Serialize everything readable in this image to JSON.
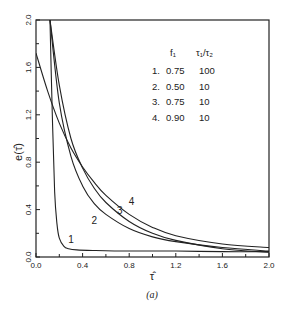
{
  "chart_data": {
    "type": "line",
    "title": "",
    "caption": "(a)",
    "xlabel": "τ̂",
    "ylabel": "e(τ̂)",
    "xlim": [
      0.0,
      2.0
    ],
    "ylim": [
      0.0,
      2.0
    ],
    "xticks": [
      "0.0",
      "0.4",
      "0.8",
      "1.2",
      "1.6",
      "2.0"
    ],
    "yticks": [
      "0.0",
      "0.4",
      "0.8",
      "1.2",
      "1.6",
      "2.0"
    ],
    "grid": false,
    "legend": {
      "position": "upper-right",
      "headers": [
        "",
        "f₁",
        "τ₁/τ₂"
      ],
      "rows": [
        {
          "id": "1.",
          "f1": "0.75",
          "ratio": "100"
        },
        {
          "id": "2.",
          "f1": "0.50",
          "ratio": "10"
        },
        {
          "id": "3.",
          "f1": "0.75",
          "ratio": "10"
        },
        {
          "id": "4.",
          "f1": "0.90",
          "ratio": "10"
        }
      ]
    },
    "series": [
      {
        "name": "1",
        "f1": 0.75,
        "ratio": 100,
        "x": [
          0.12,
          0.14,
          0.16,
          0.18,
          0.2,
          0.24,
          0.28,
          0.35,
          0.5,
          0.8,
          1.2,
          1.6,
          2.0
        ],
        "y": [
          2.0,
          1.2,
          0.55,
          0.28,
          0.16,
          0.09,
          0.07,
          0.06,
          0.055,
          0.05,
          0.05,
          0.045,
          0.045
        ]
      },
      {
        "name": "2",
        "f1": 0.5,
        "ratio": 10,
        "x": [
          0.12,
          0.2,
          0.3,
          0.4,
          0.5,
          0.6,
          0.8,
          1.0,
          1.2,
          1.6,
          2.0
        ],
        "y": [
          2.0,
          1.3,
          0.85,
          0.6,
          0.45,
          0.36,
          0.24,
          0.17,
          0.13,
          0.08,
          0.05
        ]
      },
      {
        "name": "3",
        "f1": 0.75,
        "ratio": 10,
        "x": [
          0.12,
          0.2,
          0.3,
          0.4,
          0.5,
          0.6,
          0.8,
          1.0,
          1.2,
          1.6,
          2.0
        ],
        "y": [
          2.0,
          1.45,
          1.0,
          0.75,
          0.58,
          0.46,
          0.3,
          0.2,
          0.14,
          0.07,
          0.04
        ]
      },
      {
        "name": "4",
        "f1": 0.9,
        "ratio": 10,
        "x": [
          0.0,
          0.1,
          0.2,
          0.3,
          0.4,
          0.5,
          0.6,
          0.8,
          1.0,
          1.2,
          1.6,
          2.0
        ],
        "y": [
          1.72,
          1.4,
          1.13,
          0.92,
          0.76,
          0.63,
          0.52,
          0.36,
          0.25,
          0.18,
          0.11,
          0.08
        ]
      }
    ],
    "curve_labels": [
      {
        "text": "1",
        "x": 0.3,
        "y": 0.12
      },
      {
        "text": "2",
        "x": 0.5,
        "y": 0.28
      },
      {
        "text": "3",
        "x": 0.72,
        "y": 0.36
      },
      {
        "text": "4",
        "x": 0.82,
        "y": 0.44
      }
    ]
  }
}
